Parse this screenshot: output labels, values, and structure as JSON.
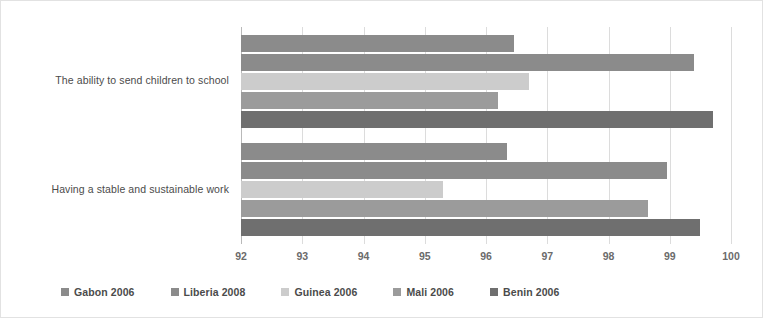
{
  "chart_data": {
    "type": "bar",
    "orientation": "horizontal",
    "title": "",
    "subtitle": "",
    "xlabel": "",
    "ylabel": "",
    "xlim": [
      92,
      100
    ],
    "xticks": [
      92,
      93,
      94,
      95,
      96,
      97,
      98,
      99,
      100
    ],
    "xtick_labels": [
      "92",
      "93",
      "94",
      "95",
      "96",
      "97",
      "98",
      "99",
      "100"
    ],
    "grid": true,
    "legend_position": "bottom",
    "categories": [
      "The ability to send children to school",
      "Having a stable and sustainable work"
    ],
    "series": [
      {
        "name": "Gabon 2006",
        "color": "#8b8b8b",
        "values": [
          96.45,
          96.35
        ]
      },
      {
        "name": "Liberia 2008",
        "color": "#8b8b8b",
        "values": [
          99.4,
          98.95
        ]
      },
      {
        "name": "Guinea 2006",
        "color": "#cccccc",
        "values": [
          96.7,
          95.3
        ]
      },
      {
        "name": "Mali 2006",
        "color": "#9b9b9b",
        "values": [
          96.2,
          98.65
        ]
      },
      {
        "name": "Benin 2006",
        "color": "#6f6f6f",
        "values": [
          99.7,
          99.5
        ]
      }
    ]
  },
  "legend": {
    "items": [
      {
        "label": "Gabon 2006",
        "color": "#8b8b8b"
      },
      {
        "label": "Liberia 2008",
        "color": "#8b8b8b"
      },
      {
        "label": "Guinea 2006",
        "color": "#cccccc"
      },
      {
        "label": "Mali 2006",
        "color": "#9b9b9b"
      },
      {
        "label": "Benin 2006",
        "color": "#6f6f6f"
      }
    ]
  },
  "colors": {
    "background": "#ffffff",
    "border": "#e2e2e2",
    "gridline": "#dcdcdc",
    "axis": "#b9b9b9",
    "text": "#4b4b4b",
    "tick_text": "#6b6b6b"
  }
}
